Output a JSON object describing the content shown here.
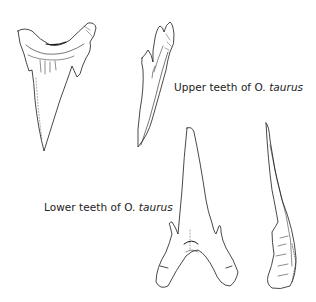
{
  "figure": {
    "upper_label": {
      "prefix": "Upper teeth of ",
      "genus": "O.",
      "species": "taurus"
    },
    "lower_label": {
      "prefix": "Lower teeth of ",
      "genus": "O.",
      "species": "taurus"
    },
    "drawings": [
      {
        "id": "upper-tooth-front",
        "description": "Upper tooth, labial view"
      },
      {
        "id": "upper-tooth-side",
        "description": "Upper tooth, lateral view"
      },
      {
        "id": "lower-tooth-front",
        "description": "Lower tooth, labial view"
      },
      {
        "id": "lower-tooth-side",
        "description": "Lower tooth, lateral view"
      }
    ],
    "line_color": "#1a1a1a",
    "background": "#ffffff"
  }
}
